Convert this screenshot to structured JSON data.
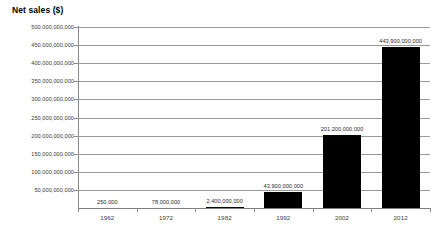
{
  "chart_data": {
    "type": "bar",
    "title": "Net sales ($)",
    "xlabel": "",
    "ylabel": "Net sales ($)",
    "categories": [
      "1962",
      "1972",
      "1982",
      "1992",
      "2002",
      "2012"
    ],
    "values": [
      250000,
      78000000,
      2400000000,
      43900000000,
      201200000000,
      443900000000
    ],
    "value_labels": [
      "250,000",
      "78,000,000",
      "2,400,000,000",
      "43,900,000,000",
      "201,200,000,000",
      "443,900,000,000"
    ],
    "ylim": [
      0,
      500000000000
    ],
    "ytick_values": [
      500000000000,
      450000000000,
      400000000000,
      350000000000,
      300000000000,
      250000000000,
      200000000000,
      150000000000,
      100000000000,
      50000000000
    ],
    "ytick_labels": [
      "500,000,000,000",
      "450,000,000,000",
      "400,000,000,000",
      "350,000,000,000",
      "300,000,000,000",
      "250,000,000,000",
      "200,000,000,000",
      "150,000,000,000",
      "100,000,000,000",
      "50,000,000,000"
    ],
    "grid": true,
    "legend": "none",
    "bar_color": "#000000",
    "gridline_color": "#9a9a9a",
    "axis_color": "#8a8a8a",
    "background": "#ffffff"
  }
}
